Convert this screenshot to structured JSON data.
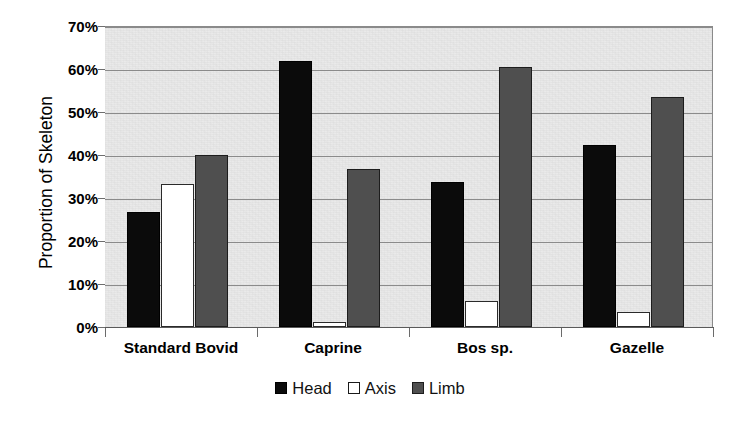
{
  "chart_data": {
    "type": "bar",
    "title": "",
    "xlabel": "",
    "ylabel": "Proportion of Skeleton",
    "ylim": [
      0,
      70
    ],
    "ytick_labels": [
      "0%",
      "10%",
      "20%",
      "30%",
      "40%",
      "50%",
      "60%",
      "70%"
    ],
    "ytick_values": [
      0,
      10,
      20,
      30,
      40,
      50,
      60,
      70
    ],
    "grid": true,
    "legend_position": "bottom-center",
    "categories": [
      "Standard Bovid",
      "Caprine",
      "Bos sp.",
      "Gazelle"
    ],
    "series": [
      {
        "name": "Head",
        "color": "#0b0b0b",
        "values": [
          26.8,
          61.8,
          33.7,
          42.3
        ]
      },
      {
        "name": "Axis",
        "color": "#ffffff",
        "values": [
          33.3,
          1.2,
          6.0,
          3.6
        ]
      },
      {
        "name": "Limb",
        "color": "#4f4f4f",
        "values": [
          40.0,
          36.8,
          60.5,
          53.6
        ]
      }
    ]
  },
  "legend": {
    "items": [
      {
        "label": "Head",
        "swatch": "black-square-icon"
      },
      {
        "label": "Axis",
        "swatch": "white-square-icon"
      },
      {
        "label": "Limb",
        "swatch": "gray-square-icon"
      }
    ]
  },
  "axes": {
    "y_title": "Proportion of Skeleton"
  }
}
